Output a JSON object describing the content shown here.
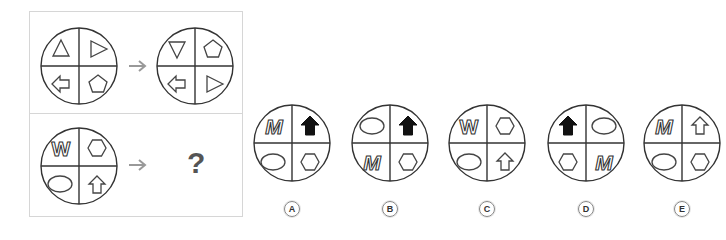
{
  "puzzle": {
    "example": {
      "before": {
        "tl": "triangle-up",
        "tr": "triangle-right",
        "bl": "arrow-left-outline",
        "br": "pentagon"
      },
      "after": {
        "tl": "triangle-down",
        "tr": "pentagon",
        "bl": "arrow-left-outline",
        "br": "triangle-right"
      }
    },
    "question": {
      "before": {
        "tl": "letter-W",
        "tr": "hexagon",
        "bl": "ellipse",
        "br": "arrow-up-outline"
      },
      "unknown": "?"
    },
    "arrow_color": "#999999"
  },
  "options": [
    {
      "label": "A",
      "tl": "letter-M",
      "tr": "arrow-up-filled",
      "bl": "ellipse",
      "br": "hexagon"
    },
    {
      "label": "B",
      "tl": "ellipse",
      "tr": "arrow-up-filled",
      "bl": "letter-M",
      "br": "hexagon"
    },
    {
      "label": "C",
      "tl": "letter-W",
      "tr": "hexagon",
      "bl": "ellipse",
      "br": "arrow-up-outline"
    },
    {
      "label": "D",
      "tl": "arrow-up-filled",
      "tr": "ellipse",
      "bl": "hexagon",
      "br": "letter-M"
    },
    {
      "label": "E",
      "tl": "letter-M",
      "tr": "arrow-up-outline",
      "bl": "ellipse",
      "br": "hexagon"
    }
  ]
}
